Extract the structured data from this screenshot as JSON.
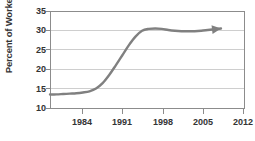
{
  "chart_data": {
    "type": "line",
    "title": "",
    "subtitle": "",
    "xlabel": "",
    "ylabel": "Percent of Workers",
    "xlim": [
      1984,
      2013.5
    ],
    "ylim": [
      10,
      35
    ],
    "grid": true,
    "grid_axis": "y",
    "legend": false,
    "legend_position": "none",
    "series_color": "#808080",
    "grid_color": "#c8c8c8",
    "axis_color": "#808080",
    "text_color": "#333333",
    "background": "#ffffff",
    "yticks": [
      10,
      15,
      20,
      25,
      30,
      35
    ],
    "ytick_labels": [
      "10",
      "15",
      "20",
      "25",
      "30",
      "35"
    ],
    "xticks": [
      1984,
      1991,
      1998,
      2005,
      2012
    ],
    "xtick_labels": [
      "1984",
      "1991",
      "1998",
      "2005",
      "2012"
    ],
    "annotation": "arrowhead at end of trend line",
    "arrow_end": true,
    "series": [
      {
        "name": "Percent of Workers",
        "x": [
          1984,
          1985,
          1986,
          1987,
          1988,
          1989,
          1990,
          1991,
          1992,
          1993,
          1994,
          1995,
          1996,
          1997,
          1998,
          1999,
          2000,
          2001,
          2002,
          2003,
          2004,
          2005,
          2006,
          2007,
          2008,
          2009,
          2010
        ],
        "values": [
          13.5,
          13.5,
          13.6,
          13.7,
          13.8,
          14.0,
          14.3,
          15.0,
          16.4,
          18.5,
          21.0,
          23.6,
          26.2,
          28.4,
          29.9,
          30.4,
          30.5,
          30.4,
          30.1,
          29.9,
          29.8,
          29.8,
          29.8,
          29.9,
          30.1,
          30.3,
          30.5
        ]
      }
    ]
  }
}
